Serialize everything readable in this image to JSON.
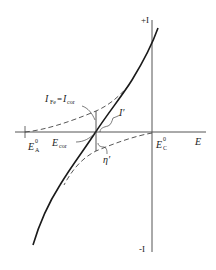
{
  "diagram": {
    "title": "",
    "axes": {
      "x_label": "E",
      "y_top_label": "+I",
      "y_bottom_label": "-I"
    },
    "labels": {
      "anodic_equilibrium": {
        "main": "E",
        "sup": "0",
        "sub": "A"
      },
      "cathodic_equilibrium": {
        "main": "E",
        "sup": "0",
        "sub": "C"
      },
      "corrosion_potential": {
        "main": "E",
        "sub": "cor"
      },
      "corrosion_current": {
        "left_main": "I",
        "left_sub": "Fe",
        "eq": "=",
        "right_main": "I",
        "right_sub": "cor"
      },
      "applied_current": "I′",
      "overpotential": "η′"
    },
    "curves": [
      {
        "name": "measured polarization curve",
        "style": "solid"
      },
      {
        "name": "anodic partial curve",
        "style": "dashed"
      },
      {
        "name": "cathodic partial curve",
        "style": "dashed"
      }
    ],
    "colors": {
      "line": "#1a1a1a",
      "axis": "#555555",
      "dashed": "#444444"
    }
  }
}
